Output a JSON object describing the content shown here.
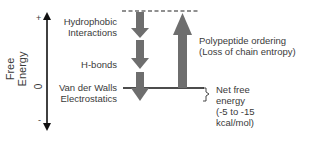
{
  "diagram": {
    "y_axis": {
      "title": "Free Energy",
      "ticks": {
        "plus": "+",
        "zero": "0",
        "minus": "-"
      }
    },
    "contributions_down": [
      {
        "label_line1": "Hydrophobic",
        "label_line2": "Interactions"
      },
      {
        "label_line1": "H-bonds",
        "label_line2": ""
      },
      {
        "label_line1": "Van der Walls",
        "label_line2": "Electrostatics"
      }
    ],
    "contribution_up": {
      "label_line1": "Polypeptide ordering",
      "label_line2": "(Loss of chain entropy)"
    },
    "net": {
      "line1": "Net free",
      "line2": "energy",
      "line3": "(-5 to -15",
      "line4": "kcal/mol)"
    },
    "colors": {
      "arrow_fill": "#6e6e6e",
      "line": "#111111",
      "text": "#3a3a3a"
    }
  }
}
